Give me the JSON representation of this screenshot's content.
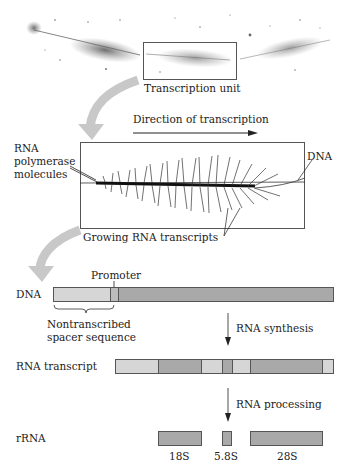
{
  "micrograph": {
    "unit_label": "Transcription unit"
  },
  "detail": {
    "direction_label": "Direction of transcription",
    "polymerase_label_lines": [
      "RNA",
      "polymerase",
      "molecules"
    ],
    "dna_label": "DNA",
    "transcripts_label": "Growing RNA transcripts"
  },
  "gene_map": {
    "dna_row": {
      "label": "DNA",
      "promoter_label": "Promoter",
      "spacer_label_lines": [
        "Nontranscribed",
        "spacer sequence"
      ]
    },
    "step1_label": "RNA synthesis",
    "transcript_row": {
      "label": "RNA transcript"
    },
    "step2_label": "RNA processing",
    "rrna_row": {
      "label": "rRNA",
      "products": [
        {
          "name": "18S"
        },
        {
          "name": "5.8S"
        },
        {
          "name": "28S"
        }
      ]
    }
  },
  "colors": {
    "light_segment": "#d6d6d6",
    "dark_segment": "#a9a9a9",
    "outline": "#555555",
    "curved_arrow": "#c8c8c8"
  }
}
